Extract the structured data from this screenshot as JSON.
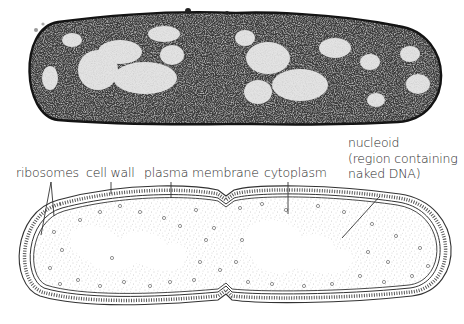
{
  "figure": {
    "top_panel": {
      "type": "electron-micrograph",
      "subject": "rod-shaped bacterium (dividing)"
    },
    "bottom_panel": {
      "type": "labelled-drawing",
      "labels": {
        "ribosomes": "ribosomes",
        "cell_wall": "cell wall",
        "plasma_membrane": "plasma membrane",
        "cytoplasm": "cytoplasm",
        "nucleoid": "nucleoid\n(region containing\nnaked DNA)"
      }
    }
  },
  "colors": {
    "label_text": "#2b2b2b",
    "line": "#333333",
    "micrograph_dark": "#1a1a1a",
    "stipple": "#9a9a9a"
  }
}
